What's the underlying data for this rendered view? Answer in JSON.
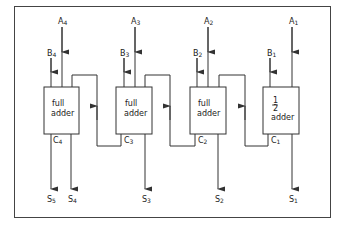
{
  "diagram": {
    "colors": {
      "line": "#333333",
      "background": "#ffffff"
    },
    "adders": [
      {
        "id": "fa4",
        "line1": "full",
        "line2": "adder",
        "carry_out": "C",
        "carry_sub": "4",
        "input_a": "A",
        "a_sub": "4",
        "input_b": "B",
        "b_sub": "4",
        "sum": "S",
        "sum_sub": "4"
      },
      {
        "id": "fa3",
        "line1": "full",
        "line2": "adder",
        "carry_out": "C",
        "carry_sub": "3",
        "input_a": "A",
        "a_sub": "3",
        "input_b": "B",
        "b_sub": "3",
        "sum": "S",
        "sum_sub": "3"
      },
      {
        "id": "fa2",
        "line1": "full",
        "line2": "adder",
        "carry_out": "C",
        "carry_sub": "2",
        "input_a": "A",
        "a_sub": "2",
        "input_b": "B",
        "b_sub": "2",
        "sum": "S",
        "sum_sub": "2"
      },
      {
        "id": "ha1",
        "frac_num": "1",
        "frac_den": "2",
        "line2": "adder",
        "carry_out": "C",
        "carry_sub": "1",
        "input_a": "A",
        "a_sub": "1",
        "input_b": "B",
        "b_sub": "1",
        "sum": "S",
        "sum_sub": "1"
      }
    ],
    "final_carry": {
      "label": "S",
      "sub": "5"
    }
  }
}
